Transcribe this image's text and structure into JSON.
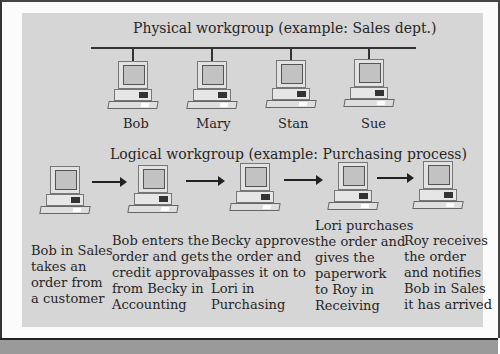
{
  "physical": {
    "title": "Physical workgroup (example: Sales dept.)",
    "members": [
      "Bob",
      "Mary",
      "Stan",
      "Sue"
    ]
  },
  "logical": {
    "title": "Logical workgroup (example: Purchasing process)",
    "steps": [
      {
        "text": "Bob in Sales\ntakes an\norder from\na customer",
        "icon": "computer-icon"
      },
      {
        "text": "Bob enters the\norder and gets\ncredit approval\nfrom Becky in\nAccounting",
        "icon": "computer-icon"
      },
      {
        "text": "Becky approves\nthe order and\npasses it on to\nLori in\nPurchasing",
        "icon": "computer-icon"
      },
      {
        "text": "Lori purchases\nthe order and\ngives the\npaperwork\nto Roy in\nReceiving",
        "icon": "computer-icon"
      },
      {
        "text": "Roy receives\nthe order\nand notifies\nBob in Sales\nit has arrived",
        "icon": "computer-icon"
      }
    ]
  },
  "colors": {
    "panel": "#d6d6d6",
    "line": "#333333",
    "bottom_strip": "#9a9a9a"
  }
}
